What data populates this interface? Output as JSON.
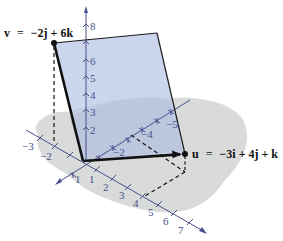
{
  "figure": {
    "colors": {
      "plane_fill": "#b9c7e6",
      "plane_edge": "#1b1b1b",
      "shadow": "#d9dada",
      "shadow_dark": "#b3b5b8",
      "axis": "#4a4f8c",
      "vector": "#111111"
    },
    "vectors": {
      "v": {
        "name": "v",
        "label_prefix": "v",
        "label_eq": "=",
        "label_rhs": "−2j + 6k",
        "components": [
          0,
          -2,
          6
        ]
      },
      "u": {
        "name": "u",
        "label_prefix": "u",
        "label_eq": "=",
        "label_rhs": "−3i + 4j + k",
        "components": [
          -3,
          4,
          1
        ]
      }
    },
    "axes": {
      "z_ticks": [
        "2",
        "3",
        "4",
        "5",
        "6",
        "8"
      ],
      "x_ticks_negative": [
        "−3",
        "−2"
      ],
      "x_ticks_positive": [
        "1",
        "2",
        "3",
        "4",
        "5",
        "6",
        "7"
      ],
      "y_ticks_negative_labels": [
        "−2",
        "−4",
        "−5"
      ],
      "y_ticks_positive": [
        "1"
      ]
    }
  }
}
